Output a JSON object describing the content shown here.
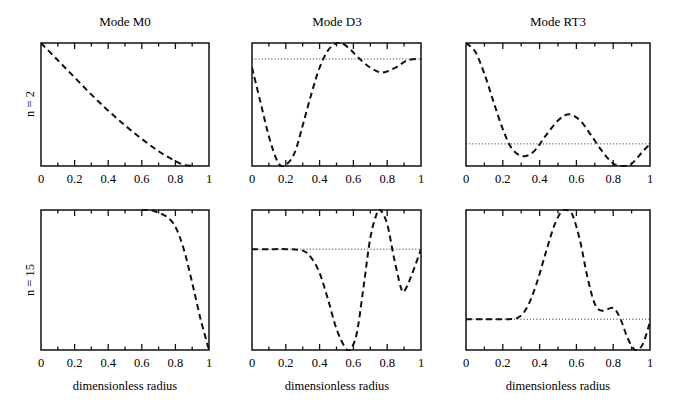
{
  "chart_data": {
    "type": "line",
    "layout": "2x3 grid of small multiples",
    "columns": [
      "Mode M0",
      "Mode D3",
      "Mode RT3"
    ],
    "rows": [
      "n = 2",
      "n = 15"
    ],
    "xlabel": "dimensionless radius",
    "xlim": [
      0,
      1
    ],
    "xticks": [
      "0",
      "0.2",
      "0.4",
      "0.6",
      "0.8",
      "1"
    ],
    "ylabel": "",
    "yticks": [],
    "grid": false,
    "legend": null,
    "line_style": "dashed",
    "reference_line_style": "dotted horizontal",
    "panels": [
      {
        "row": "n = 2",
        "column": "Mode M0",
        "x": [
          0,
          0.1,
          0.2,
          0.3,
          0.4,
          0.5,
          0.6,
          0.7,
          0.8,
          0.85,
          0.9
        ],
        "y": [
          1.0,
          0.86,
          0.72,
          0.58,
          0.45,
          0.33,
          0.22,
          0.12,
          0.04,
          0.01,
          0.0
        ],
        "reference_level": null
      },
      {
        "row": "n = 2",
        "column": "Mode D3",
        "x": [
          0,
          0.05,
          0.1,
          0.15,
          0.19,
          0.25,
          0.3,
          0.35,
          0.4,
          0.45,
          0.5,
          0.53,
          0.58,
          0.63,
          0.7,
          0.77,
          0.85,
          0.92,
          1.0
        ],
        "y": [
          0.8,
          0.52,
          0.24,
          0.04,
          0.0,
          0.1,
          0.33,
          0.58,
          0.8,
          0.94,
          1.0,
          1.0,
          0.95,
          0.88,
          0.8,
          0.76,
          0.8,
          0.86,
          0.87
        ],
        "reference_level": 0.87
      },
      {
        "row": "n = 2",
        "column": "Mode RT3",
        "x": [
          0,
          0.05,
          0.1,
          0.15,
          0.2,
          0.25,
          0.31,
          0.37,
          0.43,
          0.5,
          0.56,
          0.62,
          0.68,
          0.74,
          0.8,
          0.85,
          0.9,
          0.95,
          1.0
        ],
        "y": [
          1.0,
          0.93,
          0.75,
          0.52,
          0.3,
          0.14,
          0.08,
          0.12,
          0.24,
          0.37,
          0.42,
          0.37,
          0.25,
          0.12,
          0.02,
          0.0,
          0.02,
          0.1,
          0.18
        ],
        "reference_level": 0.18
      },
      {
        "row": "n = 15",
        "column": "Mode M0",
        "x": [
          0.6,
          0.65,
          0.7,
          0.75,
          0.8,
          0.85,
          0.9,
          0.95,
          1.0
        ],
        "y": [
          1.0,
          1.0,
          0.98,
          0.95,
          0.88,
          0.72,
          0.48,
          0.22,
          0.0
        ],
        "reference_level": null
      },
      {
        "row": "n = 15",
        "column": "Mode D3",
        "x": [
          0,
          0.1,
          0.2,
          0.3,
          0.35,
          0.4,
          0.45,
          0.5,
          0.55,
          0.58,
          0.62,
          0.66,
          0.7,
          0.74,
          0.76,
          0.8,
          0.84,
          0.88,
          0.9,
          0.94,
          1.0
        ],
        "y": [
          0.72,
          0.72,
          0.72,
          0.71,
          0.66,
          0.55,
          0.36,
          0.15,
          0.02,
          0.0,
          0.12,
          0.45,
          0.8,
          0.98,
          1.0,
          0.9,
          0.66,
          0.45,
          0.42,
          0.52,
          0.72
        ],
        "reference_level": 0.72
      },
      {
        "row": "n = 15",
        "column": "Mode RT3",
        "x": [
          0,
          0.1,
          0.2,
          0.28,
          0.33,
          0.38,
          0.43,
          0.48,
          0.52,
          0.55,
          0.58,
          0.62,
          0.66,
          0.7,
          0.74,
          0.8,
          0.84,
          0.88,
          0.92,
          0.96,
          1.0
        ],
        "y": [
          0.22,
          0.22,
          0.22,
          0.23,
          0.3,
          0.46,
          0.68,
          0.89,
          0.99,
          1.0,
          0.96,
          0.78,
          0.52,
          0.33,
          0.28,
          0.3,
          0.22,
          0.08,
          0.0,
          0.04,
          0.2
        ],
        "reference_level": 0.22
      }
    ]
  },
  "figure": {
    "col_titles": [
      "Mode M0",
      "Mode D3",
      "Mode RT3"
    ],
    "row_labels": [
      "n = 2",
      "n = 15"
    ],
    "xlabel": "dimensionless radius",
    "xticks": [
      "0",
      "0.2",
      "0.4",
      "0.6",
      "0.8",
      "1"
    ]
  }
}
